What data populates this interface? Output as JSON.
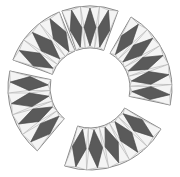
{
  "figure": {
    "center": [
      90,
      88
    ],
    "outer_radius": 82,
    "inner_radius": 40,
    "colors": {
      "background": "#ffffff",
      "light_fill": "#f1f1f1",
      "dark_fill": "#5a5a5a",
      "outline": "#6f6f6f"
    },
    "segments": [
      {
        "name": "top-left-piece",
        "start_deg": 200,
        "end_deg": 248,
        "tiles": 3
      },
      {
        "name": "top-right-piece",
        "start_deg": 250,
        "end_deg": 290,
        "tiles": 3
      },
      {
        "name": "right-piece",
        "start_deg": 300,
        "end_deg": 372,
        "tiles": 5
      },
      {
        "name": "bottom-piece",
        "start_deg": 30,
        "end_deg": 108,
        "tiles": 5
      },
      {
        "name": "left-piece",
        "start_deg": 130,
        "end_deg": 192,
        "tiles": 4
      }
    ]
  }
}
